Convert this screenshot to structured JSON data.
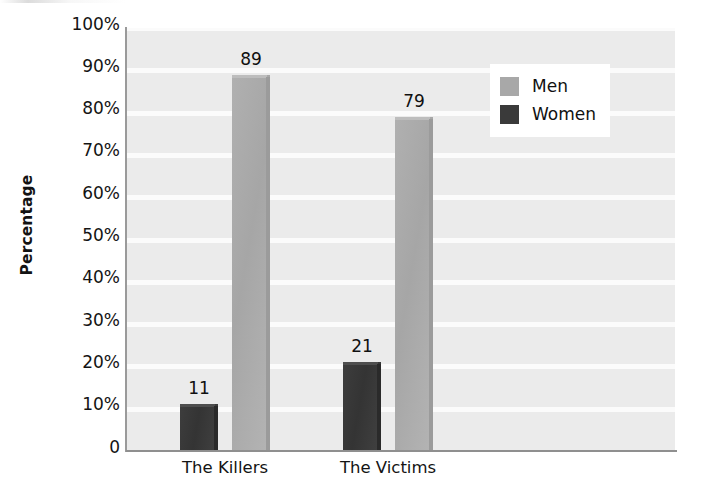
{
  "chart_data": {
    "type": "bar",
    "title": "",
    "subtitle": "",
    "xlabel": "",
    "ylabel": "Percentage",
    "categories": [
      "The Killers",
      "The Victims"
    ],
    "series": [
      {
        "name": "Women",
        "values": [
          11,
          21
        ],
        "color": "#3a3a3a"
      },
      {
        "name": "Men",
        "values": [
          89,
          79
        ],
        "color": "#a8a8a8"
      }
    ],
    "series_draw_order": [
      "Women",
      "Men"
    ],
    "ylim": [
      0,
      100
    ],
    "ytick_values": [
      0,
      10,
      20,
      30,
      40,
      50,
      60,
      70,
      80,
      90,
      100
    ],
    "ytick_labels": [
      "0",
      "10%",
      "20%",
      "30%",
      "40%",
      "50%",
      "60%",
      "70%",
      "80%",
      "90%",
      "100%"
    ],
    "data_labels": [
      "11",
      "89",
      "21",
      "79"
    ],
    "grid": "horizontal-white-bands",
    "legend_position": "top-right-inside",
    "plot_background": "#ebebeb",
    "gridline_color": "#fbfbfb"
  },
  "axes": {
    "y_title": "Percentage",
    "y_ticks": [
      {
        "label": "100%",
        "value": 100
      },
      {
        "label": "90%",
        "value": 90
      },
      {
        "label": "80%",
        "value": 80
      },
      {
        "label": "70%",
        "value": 70
      },
      {
        "label": "60%",
        "value": 60
      },
      {
        "label": "50%",
        "value": 50
      },
      {
        "label": "40%",
        "value": 40
      },
      {
        "label": "30%",
        "value": 30
      },
      {
        "label": "20%",
        "value": 20
      },
      {
        "label": "10%",
        "value": 10
      },
      {
        "label": "0",
        "value": 0
      }
    ],
    "x_ticks": [
      {
        "label": "The Killers"
      },
      {
        "label": "The Victims"
      }
    ]
  },
  "bars": [
    {
      "group": "The Killers",
      "series": "Women",
      "value": 11,
      "label": "11",
      "class": "women"
    },
    {
      "group": "The Killers",
      "series": "Men",
      "value": 89,
      "label": "89",
      "class": "men"
    },
    {
      "group": "The Victims",
      "series": "Women",
      "value": 21,
      "label": "21",
      "class": "women"
    },
    {
      "group": "The Victims",
      "series": "Men",
      "value": 79,
      "label": "79",
      "class": "men"
    }
  ],
  "legend": {
    "items": [
      {
        "label": "Men",
        "color": "#a8a8a8"
      },
      {
        "label": "Women",
        "color": "#3a3a3a"
      }
    ]
  }
}
